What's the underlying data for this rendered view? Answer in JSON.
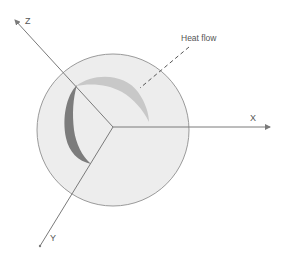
{
  "diagram": {
    "type": "3d-axes-sphere",
    "axes": {
      "x_label": "X",
      "y_label": "Y",
      "z_label": "Z"
    },
    "annotation": {
      "heat_flow_label": "Heat flow"
    },
    "colors": {
      "sphere_fill": "#ededed",
      "sphere_stroke": "#9a9a9a",
      "axis": "#7a7a7a",
      "light_band": "#c8c8c8",
      "dark_band": "#7c7c7c",
      "text": "#555555"
    }
  }
}
